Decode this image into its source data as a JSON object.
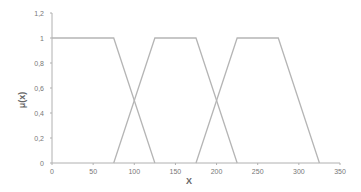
{
  "chart_data": {
    "type": "line",
    "title": "",
    "xlabel": "X",
    "ylabel": "μ(x)",
    "xlim": [
      0,
      350
    ],
    "ylim": [
      0,
      1.2
    ],
    "x_ticks": [
      0,
      50,
      100,
      150,
      200,
      250,
      300,
      350
    ],
    "x_tick_labels": [
      "0",
      "50",
      "100",
      "150",
      "200",
      "250",
      "300",
      "350"
    ],
    "y_ticks": [
      0,
      0.2,
      0.4,
      0.6,
      0.8,
      1,
      1.2
    ],
    "y_tick_labels": [
      "0",
      "0,2",
      "0,4",
      "0,6",
      "0,8",
      "1",
      "1,2"
    ],
    "grid": false,
    "legend": null,
    "line_color": "#b5b5b5",
    "series": [
      {
        "name": "trapezoid-1",
        "x": [
          0,
          75,
          125
        ],
        "y": [
          1,
          1,
          0
        ]
      },
      {
        "name": "trapezoid-2",
        "x": [
          75,
          125,
          175,
          225
        ],
        "y": [
          0,
          1,
          1,
          0
        ]
      },
      {
        "name": "trapezoid-3",
        "x": [
          175,
          225,
          275,
          325
        ],
        "y": [
          0,
          1,
          1,
          0
        ]
      }
    ]
  }
}
